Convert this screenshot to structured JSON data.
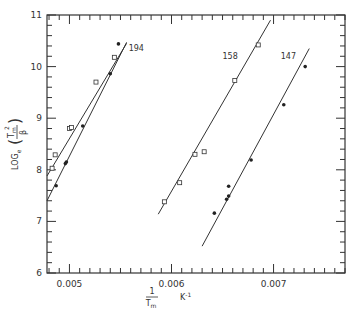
{
  "chart_data": {
    "type": "scatter",
    "title": "",
    "xlabel_num": "1",
    "xlabel_den": "T",
    "xlabel_den_sub": "m",
    "xlabel_unit": "K",
    "xlabel_unit_exp": "-1",
    "ylabel_prefix": "LOG",
    "ylabel_sub": "e",
    "ylabel_num": "T",
    "ylabel_num_sub": "m",
    "ylabel_num_exp": "2",
    "ylabel_den": "β",
    "xlim": [
      0.00478,
      0.0077
    ],
    "ylim": [
      6,
      11
    ],
    "xticks": [
      0.005,
      0.006,
      0.007
    ],
    "xtick_labels": [
      "0.005",
      "0.006",
      "0.007"
    ],
    "yticks": [
      6,
      7,
      8,
      9,
      10,
      11
    ],
    "ytick_labels": [
      "6",
      "7",
      "8",
      "9",
      "10",
      "11"
    ],
    "grid": false,
    "series": [
      {
        "name": "194",
        "marker": "open-square",
        "points": [
          [
            0.00483,
            8.03
          ],
          [
            0.00486,
            8.29
          ],
          [
            0.005,
            8.8
          ],
          [
            0.00502,
            8.82
          ],
          [
            0.00526,
            9.7
          ],
          [
            0.00544,
            10.18
          ]
        ],
        "fit": [
          [
            0.00478,
            7.88
          ],
          [
            0.00556,
            10.45
          ]
        ]
      },
      {
        "name": "194",
        "marker": "filled-circle",
        "points": [
          [
            0.00487,
            7.69
          ],
          [
            0.00496,
            8.12
          ],
          [
            0.00497,
            8.15
          ],
          [
            0.00513,
            8.85
          ],
          [
            0.0054,
            9.86
          ],
          [
            0.00548,
            10.44
          ]
        ],
        "fit": [
          [
            0.00478,
            7.4
          ],
          [
            0.00556,
            10.47
          ]
        ]
      },
      {
        "name": "158",
        "marker": "open-square",
        "points": [
          [
            0.00593,
            7.38
          ],
          [
            0.00608,
            7.75
          ],
          [
            0.00623,
            8.3
          ],
          [
            0.00632,
            8.35
          ],
          [
            0.00662,
            9.73
          ],
          [
            0.00685,
            10.42
          ]
        ],
        "fit": [
          [
            0.00587,
            7.14
          ],
          [
            0.00697,
            10.9
          ]
        ]
      },
      {
        "name": "147",
        "marker": "filled-circle",
        "points": [
          [
            0.00642,
            7.16
          ],
          [
            0.00654,
            7.43
          ],
          [
            0.00656,
            7.49
          ],
          [
            0.00656,
            7.68
          ],
          [
            0.00678,
            8.19
          ],
          [
            0.0071,
            9.26
          ],
          [
            0.00731,
            10.0
          ]
        ],
        "fit": [
          [
            0.0063,
            6.52
          ],
          [
            0.00735,
            10.35
          ]
        ]
      }
    ],
    "annotations": [
      {
        "text": "194",
        "x": 0.00558,
        "y": 10.3
      },
      {
        "text": "158",
        "x": 0.0065,
        "y": 10.15
      },
      {
        "text": "147",
        "x": 0.00707,
        "y": 10.15
      }
    ]
  }
}
